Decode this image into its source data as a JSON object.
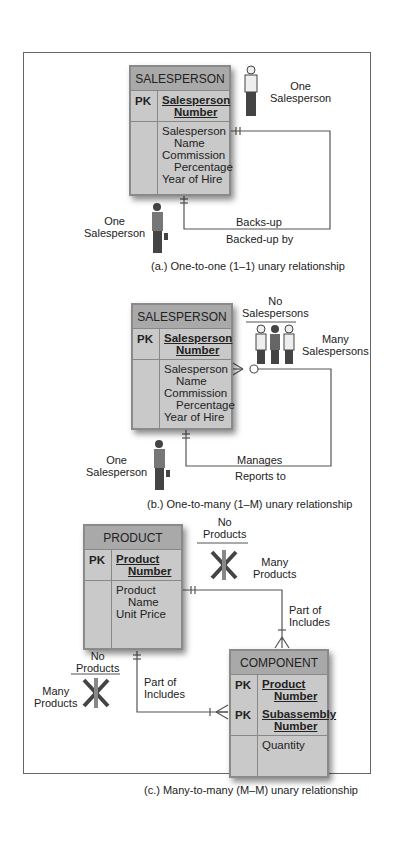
{
  "panels": [
    {
      "entity": {
        "name": "SALESPERSON",
        "pk_label": "PK",
        "pk_line1": "Salesperson",
        "pk_line2": "Number",
        "attrs": [
          "Salesperson",
          "Name",
          "Commission",
          "Percentage",
          "Year of Hire"
        ]
      },
      "top_label": {
        "line1": "One",
        "line2": "Salesperson"
      },
      "bottom_label": {
        "line1": "One",
        "line2": "Salesperson"
      },
      "rel_upper": "Backs-up",
      "rel_lower": "Backed-up by",
      "caption": "(a.) One-to-one (1–1) unary relationship"
    },
    {
      "entity": {
        "name": "SALESPERSON",
        "pk_label": "PK",
        "pk_line1": "Salesperson",
        "pk_line2": "Number",
        "attrs": [
          "Salesperson",
          "Name",
          "Commission",
          "Percentage",
          "Year of Hire"
        ]
      },
      "top_label_no": {
        "line1": "No",
        "line2": "Salespersons"
      },
      "top_label_many": {
        "line1": "Many",
        "line2": "Salespersons"
      },
      "bottom_label": {
        "line1": "One",
        "line2": "Salesperson"
      },
      "rel_upper": "Manages",
      "rel_lower": "Reports to",
      "caption": "(b.) One-to-many (1–M) unary relationship"
    },
    {
      "product": {
        "name": "PRODUCT",
        "pk_label": "PK",
        "pk_line1": "Product",
        "pk_line2": "Number",
        "attrs": [
          "Product",
          "Name",
          "Unit Price"
        ]
      },
      "component": {
        "name": "COMPONENT",
        "pk_label": "PK",
        "pk1_line1": "Product",
        "pk1_line2": "Number",
        "pk2_label": "PK",
        "pk2_line1": "Subassembly",
        "pk2_line2": "Number",
        "attrs": [
          "Quantity"
        ]
      },
      "right_no": {
        "line1": "No",
        "line2": "Products"
      },
      "right_many": {
        "line1": "Many",
        "line2": "Products"
      },
      "right_rel": {
        "line1": "Part of",
        "line2": "Includes"
      },
      "left_no": {
        "line1": "No",
        "line2": "Products"
      },
      "left_many": {
        "line1": "Many",
        "line2": "Products"
      },
      "left_rel": {
        "line1": "Part of",
        "line2": "Includes"
      },
      "caption": "(c.) Many-to-many (M–M) unary relationship"
    }
  ],
  "colors": {
    "entity_fill": "#c9c9c9",
    "entity_header": "#a9a9a9",
    "line": "#555555"
  }
}
